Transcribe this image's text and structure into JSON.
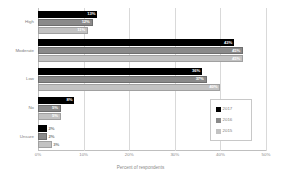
{
  "chart_data": {
    "type": "bar",
    "orientation": "horizontal",
    "title": "",
    "xlabel": "Percent of respondents",
    "ylabel": "",
    "xlim": [
      0,
      50
    ],
    "xticks": [
      "0%",
      "10%",
      "20%",
      "30%",
      "40%",
      "50%"
    ],
    "xtick_values": [
      0,
      10,
      20,
      30,
      40,
      50
    ],
    "grid": true,
    "legend_position": "lower-right",
    "categories": [
      "High",
      "Moderate",
      "Low",
      "No",
      "Unsure"
    ],
    "series": [
      {
        "name": "2017",
        "color": "#000000",
        "values": [
          13,
          43,
          36,
          8,
          2
        ],
        "labels": [
          "13%",
          "43%",
          "36%",
          "8%",
          "2%"
        ]
      },
      {
        "name": "2016",
        "color": "#8a8a8a",
        "values": [
          12,
          45,
          37,
          5,
          2
        ],
        "labels": [
          "12%",
          "45%",
          "37%",
          "5%",
          "2%"
        ]
      },
      {
        "name": "2015",
        "color": "#c2c2c2",
        "values": [
          11,
          45,
          40,
          5,
          3
        ],
        "labels": [
          "11%",
          "45%",
          "40%",
          "5%",
          "3%"
        ]
      }
    ]
  },
  "legend": {
    "items": [
      {
        "label": "2017"
      },
      {
        "label": "2016"
      },
      {
        "label": "2015"
      }
    ]
  }
}
